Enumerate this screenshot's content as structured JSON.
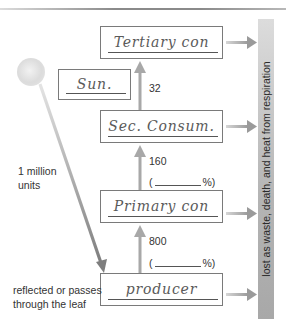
{
  "diagram": {
    "type": "energy-flow-food-chain",
    "sun": {
      "label": "Sun.",
      "incoming_energy": "1 million units",
      "incoming_energy_lines": [
        "1 million",
        "units"
      ]
    },
    "reflected_note": {
      "lines": [
        "reflected or passes",
        "through the leaf"
      ]
    },
    "levels": [
      {
        "id": "producer",
        "label": "producer"
      },
      {
        "id": "primary",
        "label": "Primary con"
      },
      {
        "id": "secondary",
        "label": "Sec. Consum."
      },
      {
        "id": "tertiary",
        "label": "Tertiary con"
      }
    ],
    "transfers": [
      {
        "from": "producer",
        "to": "primary",
        "energy": "800",
        "percent_blank": "(",
        "percent_suffix": "%)"
      },
      {
        "from": "primary",
        "to": "secondary",
        "energy": "160",
        "percent_blank": "(",
        "percent_suffix": "%)"
      },
      {
        "from": "secondary",
        "to": "tertiary",
        "energy": "32"
      }
    ],
    "loss_bar": {
      "label": "lost as waste, death, and heat from respiration"
    },
    "colors": {
      "box_border": "#7a7a7a",
      "arrow": "#a8a8a8",
      "sun_arrow": "#8c8c8c",
      "bar": "#b4b4b4",
      "text": "#333333",
      "handwriting": "#5a5a5a"
    }
  }
}
